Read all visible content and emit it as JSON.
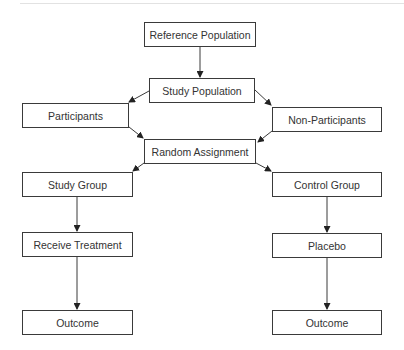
{
  "diagram": {
    "type": "flowchart",
    "title": "",
    "nodes": [
      {
        "id": "reference_population",
        "label": "Reference Population",
        "x": 144,
        "y": 22,
        "w": 112,
        "h": 25
      },
      {
        "id": "study_population",
        "label": "Study Population",
        "x": 149,
        "y": 78,
        "w": 106,
        "h": 25
      },
      {
        "id": "participants",
        "label": "Participants",
        "x": 22,
        "y": 103,
        "w": 107,
        "h": 25
      },
      {
        "id": "non_participants",
        "label": "Non-Participants",
        "x": 272,
        "y": 107,
        "w": 110,
        "h": 25
      },
      {
        "id": "random_assignment",
        "label": "Random Assignment",
        "x": 144,
        "y": 139,
        "w": 112,
        "h": 25
      },
      {
        "id": "study_group",
        "label": "Study Group",
        "x": 22,
        "y": 172,
        "w": 111,
        "h": 25
      },
      {
        "id": "control_group",
        "label": "Control Group",
        "x": 272,
        "y": 172,
        "w": 110,
        "h": 25
      },
      {
        "id": "receive_treatment",
        "label": "Receive Treatment",
        "x": 22,
        "y": 232,
        "w": 111,
        "h": 25
      },
      {
        "id": "placebo",
        "label": "Placebo",
        "x": 272,
        "y": 233,
        "w": 110,
        "h": 25
      },
      {
        "id": "outcome_study",
        "label": "Outcome",
        "x": 22,
        "y": 310,
        "w": 111,
        "h": 25
      },
      {
        "id": "outcome_control",
        "label": "Outcome",
        "x": 272,
        "y": 310,
        "w": 110,
        "h": 25
      }
    ],
    "edges": [
      {
        "from": "reference_population",
        "to": "study_population"
      },
      {
        "from": "study_population",
        "to": "participants"
      },
      {
        "from": "study_population",
        "to": "non_participants"
      },
      {
        "from": "participants",
        "to": "random_assignment"
      },
      {
        "from": "non_participants",
        "to": "random_assignment"
      },
      {
        "from": "random_assignment",
        "to": "study_group"
      },
      {
        "from": "random_assignment",
        "to": "control_group"
      },
      {
        "from": "study_group",
        "to": "receive_treatment"
      },
      {
        "from": "control_group",
        "to": "placebo"
      },
      {
        "from": "receive_treatment",
        "to": "outcome_study"
      },
      {
        "from": "placebo",
        "to": "outcome_control"
      }
    ],
    "colors": {
      "stroke": "#3a3a3a",
      "text": "#333333",
      "background": "#ffffff",
      "rule": "#e2e2e2"
    }
  }
}
